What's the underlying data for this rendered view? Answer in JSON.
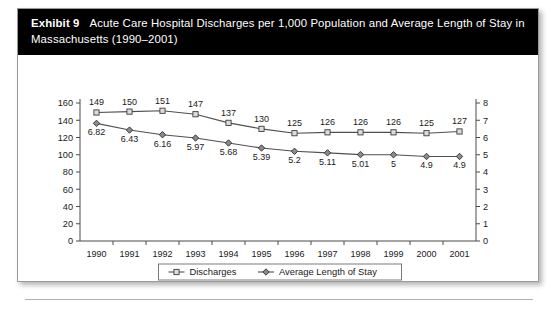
{
  "exhibit": {
    "number_label": "Exhibit 9",
    "title": "Acute Care Hospital Discharges per 1,000 Population and Average Length of Stay in Massachusetts (1990–2001)"
  },
  "colors": {
    "title_bar_background": "#000000",
    "title_text": "#ffffff",
    "card_background": "#ffffff",
    "card_border": "#9a9a9a",
    "axis": "#4a4a4a",
    "series_line": "#4f4f4f",
    "discharges_marker_fill": "#dcdcdc",
    "alos_marker_fill": "#8a8a8a"
  },
  "chart_data": {
    "type": "line",
    "title": "Acute Care Hospital Discharges per 1,000 Population and Average Length of Stay in Massachusetts (1990–2001)",
    "xlabel": "",
    "ylabel": "",
    "categories": [
      "1990",
      "1991",
      "1992",
      "1993",
      "1994",
      "1995",
      "1996",
      "1997",
      "1998",
      "1999",
      "2000",
      "2001"
    ],
    "series": [
      {
        "name": "Discharges",
        "axis": "left",
        "marker": "square",
        "values": [
          149,
          150,
          151,
          147,
          137,
          130,
          125,
          126,
          126,
          126,
          125,
          127
        ],
        "labels": [
          "149",
          "150",
          "151",
          "147",
          "137",
          "130",
          "125",
          "126",
          "126",
          "126",
          "125",
          "127"
        ]
      },
      {
        "name": "Average Length of Stay",
        "axis": "right",
        "marker": "diamond",
        "values": [
          6.82,
          6.43,
          6.16,
          5.97,
          5.68,
          5.39,
          5.2,
          5.11,
          5.01,
          5,
          4.9,
          4.9
        ],
        "labels": [
          "6.82",
          "6.43",
          "6.16",
          "5.97",
          "5.68",
          "5.39",
          "5.2",
          "5.11",
          "5.01",
          "5",
          "4.9",
          "4.9"
        ]
      }
    ],
    "left_axis": {
      "ylim": [
        0,
        160
      ],
      "ticks": [
        0,
        20,
        40,
        60,
        80,
        100,
        120,
        140,
        160
      ],
      "tick_labels": [
        "0",
        "20",
        "40",
        "60",
        "80",
        "100",
        "120",
        "140",
        "160"
      ]
    },
    "right_axis": {
      "ylim": [
        0,
        8
      ],
      "ticks": [
        0,
        1,
        2,
        3,
        4,
        5,
        6,
        7,
        8
      ],
      "tick_labels": [
        "0",
        "1",
        "2",
        "3",
        "4",
        "5",
        "6",
        "7",
        "8"
      ]
    },
    "grid": false,
    "legend_position": "bottom",
    "legend": [
      "Discharges",
      "Average Length of Stay"
    ]
  }
}
